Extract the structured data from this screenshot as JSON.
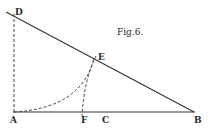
{
  "figure": {
    "caption": "Fig.6.",
    "stroke_color": "#333333",
    "background": "#ffffff",
    "points": {
      "D": {
        "label": "D",
        "x": 14,
        "y": 15
      },
      "E": {
        "label": "E",
        "x": 94,
        "y": 58
      },
      "A": {
        "label": "A",
        "x": 14,
        "y": 112
      },
      "F": {
        "label": "F",
        "x": 82,
        "y": 112
      },
      "C": {
        "label": "C",
        "x": 104,
        "y": 112
      },
      "B": {
        "label": "B",
        "x": 195,
        "y": 112
      }
    }
  }
}
